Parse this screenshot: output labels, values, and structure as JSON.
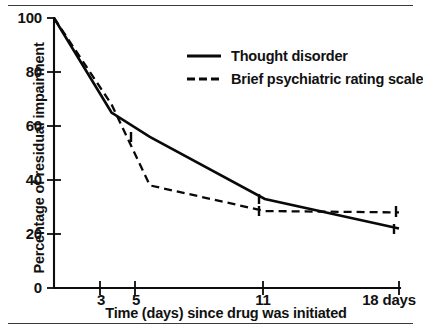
{
  "chart_data": {
    "type": "line",
    "title": "",
    "xlabel": "Time (days) since drug was initiated",
    "ylabel": "Percentage of residual impairment",
    "x": [
      0,
      3,
      5,
      11,
      18
    ],
    "xlim": [
      0,
      18
    ],
    "ylim": [
      0,
      100
    ],
    "grid": false,
    "legend_position": "upper right",
    "x_tick_labels": [
      "3",
      "5",
      "11",
      "18 days"
    ],
    "x_tick_values": [
      3,
      5,
      11,
      18
    ],
    "y_tick_labels": [
      "0",
      "20",
      "40",
      "60",
      "80",
      "100"
    ],
    "y_tick_values": [
      0,
      20,
      40,
      60,
      80,
      100
    ],
    "series": [
      {
        "name": "Thought disorder",
        "style": "solid",
        "values": [
          100,
          65,
          56,
          33,
          22
        ]
      },
      {
        "name": "Brief psychiatric rating scale",
        "style": "dashed",
        "values": [
          100,
          68,
          38,
          28.5,
          28
        ]
      }
    ]
  },
  "axes": {
    "y_label": "Percentage of residual impairment",
    "x_label": "Time (days) since drug was initiated",
    "y_ticks": [
      {
        "label": "100",
        "value": 100
      },
      {
        "label": "80",
        "value": 80
      },
      {
        "label": "60",
        "value": 60
      },
      {
        "label": "40",
        "value": 40
      },
      {
        "label": "20",
        "value": 20
      },
      {
        "label": "0",
        "value": 0
      }
    ],
    "x_ticks": [
      {
        "label": "3",
        "value": 3
      },
      {
        "label": "5",
        "value": 5
      },
      {
        "label": "11",
        "value": 11
      },
      {
        "label": "18 days",
        "value": 18
      }
    ]
  },
  "legend": {
    "entries": [
      {
        "label": "Thought disorder",
        "style": "solid"
      },
      {
        "label": "Brief psychiatric rating scale",
        "style": "dashed"
      }
    ]
  }
}
